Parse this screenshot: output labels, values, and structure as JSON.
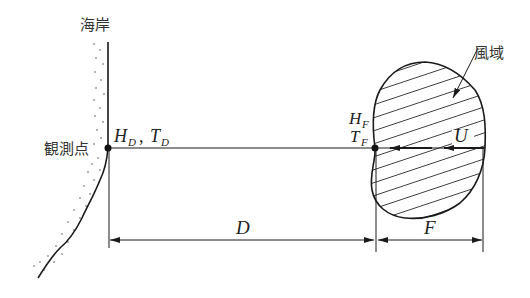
{
  "diagram": {
    "type": "wave-forecast-fetch-diagram",
    "labels": {
      "coast": "海岸",
      "observation_point": "観測点",
      "wind_area": "風域",
      "obs_wave_H": "H",
      "obs_wave_H_sub": "D",
      "obs_sep": ",",
      "obs_wave_T": "T",
      "obs_wave_T_sub": "D",
      "fetch_H": "H",
      "fetch_H_sub": "F",
      "fetch_T": "T",
      "fetch_T_sub": "F",
      "wind_speed": "U",
      "decay_distance": "D",
      "fetch_length": "F"
    },
    "colors": {
      "line": "#1a1a1a",
      "text": "#333333",
      "hatch": "#2a2a2a"
    }
  }
}
